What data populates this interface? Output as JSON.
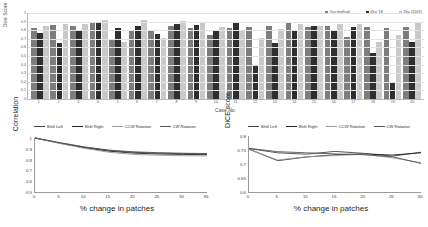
{
  "chart_data": [
    {
      "id": "dice-per-case-bar",
      "type": "bar",
      "title": "",
      "xlabel": "Case No.",
      "ylabel": "Dice Score",
      "ylim": [
        0,
        1
      ],
      "ytick_labels": [
        "1",
        "0.9",
        "0.8",
        "0.7",
        "0.6",
        "0.5",
        "0.4",
        "0.3",
        "0.2",
        "0.1",
        "0"
      ],
      "grid": true,
      "legend_position": "top-right",
      "categories": [
        "1",
        "2",
        "3",
        "4",
        "5",
        "6",
        "7",
        "8",
        "9",
        "10",
        "11",
        "12",
        "13",
        "14",
        "15",
        "16",
        "17",
        "18",
        "19",
        "20"
      ],
      "series": [
        {
          "name": "Our method",
          "color": "#7d7d7d",
          "values": [
            0.83,
            0.86,
            0.85,
            0.9,
            0.7,
            0.79,
            0.8,
            0.85,
            0.83,
            0.74,
            0.83,
            0.84,
            0.85,
            0.88,
            0.84,
            0.85,
            0.72,
            0.84,
            0.83,
            0.84
          ]
        },
        {
          "name": "Zhu '18",
          "color": "#2f2f2f",
          "values": [
            0.77,
            0.65,
            0.8,
            0.88,
            0.83,
            0.85,
            0.76,
            0.87,
            0.86,
            0.79,
            0.88,
            0.4,
            0.65,
            0.8,
            0.85,
            0.8,
            0.84,
            0.53,
            0.2,
            0.66
          ]
        },
        {
          "name": "Zhu (2019)",
          "color": "#c9c9c9",
          "values": [
            0.85,
            0.87,
            0.87,
            0.92,
            0.66,
            0.92,
            0.71,
            0.91,
            0.89,
            0.84,
            0.79,
            0.71,
            0.81,
            0.87,
            0.85,
            0.87,
            0.87,
            0.66,
            0.75,
            0.88
          ]
        }
      ]
    },
    {
      "id": "correlation-vs-patch-change",
      "type": "line",
      "title": "",
      "xlabel": "% change in patches",
      "ylabel": "Correlation",
      "xlim": [
        0,
        35
      ],
      "ylim": [
        0.5,
        1.0
      ],
      "xtick_labels": [
        "0",
        "5",
        "10",
        "15",
        "20",
        "25",
        "30",
        "35"
      ],
      "ytick_labels": [
        "1",
        "0.9",
        "0.8",
        "0.7",
        "0.6",
        "0.5"
      ],
      "grid": false,
      "legend_position": "top",
      "x": [
        0,
        5,
        10,
        15,
        20,
        25,
        30,
        35
      ],
      "series": [
        {
          "name": "Shift Left",
          "color": "#444444",
          "values": [
            1.0,
            0.955,
            0.915,
            0.885,
            0.868,
            0.86,
            0.855,
            0.852
          ]
        },
        {
          "name": "Shift Right",
          "color": "#222222",
          "values": [
            1.0,
            0.952,
            0.91,
            0.878,
            0.86,
            0.852,
            0.848,
            0.845
          ]
        },
        {
          "name": "CCW Rotation",
          "color": "#9a9a9a",
          "values": [
            1.0,
            0.95,
            0.905,
            0.868,
            0.848,
            0.84,
            0.836,
            0.834
          ]
        },
        {
          "name": "CW Rotation",
          "color": "#555555",
          "values": [
            1.0,
            0.958,
            0.918,
            0.888,
            0.872,
            0.864,
            0.859,
            0.856
          ]
        }
      ]
    },
    {
      "id": "dice-vs-patch-change",
      "type": "line",
      "title": "",
      "xlabel": "% change in patches",
      "ylabel": "DICE score",
      "xlim": [
        0,
        30
      ],
      "ylim": [
        0.6,
        0.8
      ],
      "xtick_labels": [
        "0",
        "5",
        "10",
        "15",
        "20",
        "25",
        "30"
      ],
      "ytick_labels": [
        "0.8",
        "0.75",
        "0.7",
        "0.65",
        "0.6"
      ],
      "grid": false,
      "legend_position": "top",
      "x": [
        0,
        5,
        10,
        15,
        20,
        25,
        30
      ],
      "series": [
        {
          "name": "Shift Left",
          "color": "#444444",
          "values": [
            0.755,
            0.74,
            0.735,
            0.745,
            0.738,
            0.728,
            0.742
          ]
        },
        {
          "name": "Shift Right",
          "color": "#222222",
          "values": [
            0.753,
            0.712,
            0.725,
            0.733,
            0.736,
            0.732,
            0.74
          ]
        },
        {
          "name": "CCW Rotation",
          "color": "#9a9a9a",
          "values": [
            0.752,
            0.714,
            0.726,
            0.73,
            0.735,
            0.722,
            0.705
          ]
        },
        {
          "name": "CW Rotation",
          "color": "#555555",
          "values": [
            0.756,
            0.744,
            0.74,
            0.736,
            0.733,
            0.726,
            0.702
          ]
        }
      ]
    }
  ]
}
